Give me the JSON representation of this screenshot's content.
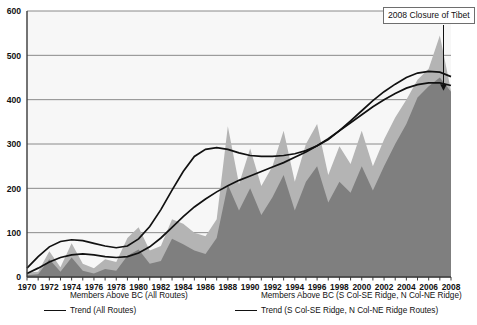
{
  "chart_data": {
    "type": "area",
    "title": "",
    "xlabel": "",
    "ylabel": "",
    "xlim": [
      1970,
      2008
    ],
    "ylim": [
      0,
      600
    ],
    "grid": true,
    "legend_position": "bottom",
    "ytick_labels": [
      "0",
      "100",
      "200",
      "300",
      "400",
      "500",
      "600"
    ],
    "ytick_values": [
      0,
      100,
      200,
      300,
      400,
      500,
      600
    ],
    "xtick_labels": [
      "1970",
      "1972",
      "1974",
      "1976",
      "1978",
      "1980",
      "1982",
      "1984",
      "1986",
      "1988",
      "1990",
      "1992",
      "1994",
      "1996",
      "1998",
      "2000",
      "2002",
      "2004",
      "2006",
      "2008"
    ],
    "x": [
      1970,
      1971,
      1972,
      1973,
      1974,
      1975,
      1976,
      1977,
      1978,
      1979,
      1980,
      1981,
      1982,
      1983,
      1984,
      1985,
      1986,
      1987,
      1988,
      1989,
      1990,
      1991,
      1992,
      1993,
      1994,
      1995,
      1996,
      1997,
      1998,
      1999,
      2000,
      2001,
      2002,
      2003,
      2004,
      2005,
      2006,
      2007,
      2008
    ],
    "series": [
      {
        "name": "Members Above BC (All Routes)",
        "kind": "area",
        "color": "#b4b4b4",
        "values": [
          10,
          12,
          58,
          22,
          76,
          30,
          20,
          40,
          34,
          88,
          112,
          60,
          70,
          130,
          120,
          100,
          92,
          130,
          340,
          210,
          290,
          205,
          250,
          330,
          215,
          300,
          345,
          230,
          295,
          255,
          330,
          250,
          310,
          360,
          400,
          445,
          470,
          545,
          420
        ]
      },
      {
        "name": "Members Above BC (S Col-SE Ridge, N Col-NE Ridge)",
        "kind": "area",
        "color": "#7f7f7f",
        "values": [
          4,
          6,
          40,
          12,
          44,
          14,
          8,
          18,
          14,
          48,
          62,
          30,
          36,
          86,
          74,
          60,
          52,
          88,
          208,
          150,
          200,
          140,
          180,
          230,
          150,
          215,
          250,
          168,
          215,
          190,
          250,
          195,
          250,
          300,
          345,
          405,
          430,
          450,
          418
        ]
      },
      {
        "name": "Trend (All Routes)",
        "kind": "line",
        "color": "#111111",
        "values": [
          20,
          46,
          68,
          80,
          84,
          82,
          76,
          70,
          66,
          70,
          86,
          114,
          152,
          196,
          238,
          272,
          288,
          292,
          288,
          280,
          274,
          272,
          272,
          274,
          278,
          285,
          296,
          310,
          330,
          352,
          375,
          398,
          418,
          435,
          450,
          460,
          464,
          462,
          452
        ]
      },
      {
        "name": "Trend (S Col-SE Ridge, N Col-NE Ridge Routes)",
        "kind": "line",
        "color": "#111111",
        "values": [
          8,
          20,
          34,
          44,
          50,
          52,
          50,
          46,
          44,
          46,
          54,
          68,
          88,
          112,
          136,
          158,
          176,
          192,
          206,
          218,
          228,
          238,
          248,
          258,
          270,
          282,
          296,
          312,
          330,
          348,
          366,
          384,
          400,
          414,
          426,
          434,
          438,
          438,
          432
        ]
      }
    ],
    "annotations": [
      {
        "text": "2008 Closure of Tibet",
        "points_to_x": 2008,
        "points_to_y": 420,
        "boxed": true
      }
    ]
  },
  "legend": {
    "left": [
      {
        "label": "Members Above BC (All Routes)",
        "marker": "area-swatch-light"
      },
      {
        "label": "Trend (All Routes)",
        "marker": "line-swatch-dark"
      }
    ],
    "right": [
      {
        "label": "Members Above BC (S Col-SE Ridge, N Col-NE Ridge)",
        "marker": "area-swatch-dark"
      },
      {
        "label": "Trend (S Col-SE Ridge, N Col-NE Ridge Routes)",
        "marker": "line-swatch-dark"
      }
    ]
  },
  "colors": {
    "area_all_routes": "#b4b4b4",
    "area_col_ridge": "#7f7f7f",
    "trend_line": "#111111",
    "gridline": "#8a8a8a",
    "axis": "#3a3a3a",
    "plot_background": "#f7f7f7"
  }
}
